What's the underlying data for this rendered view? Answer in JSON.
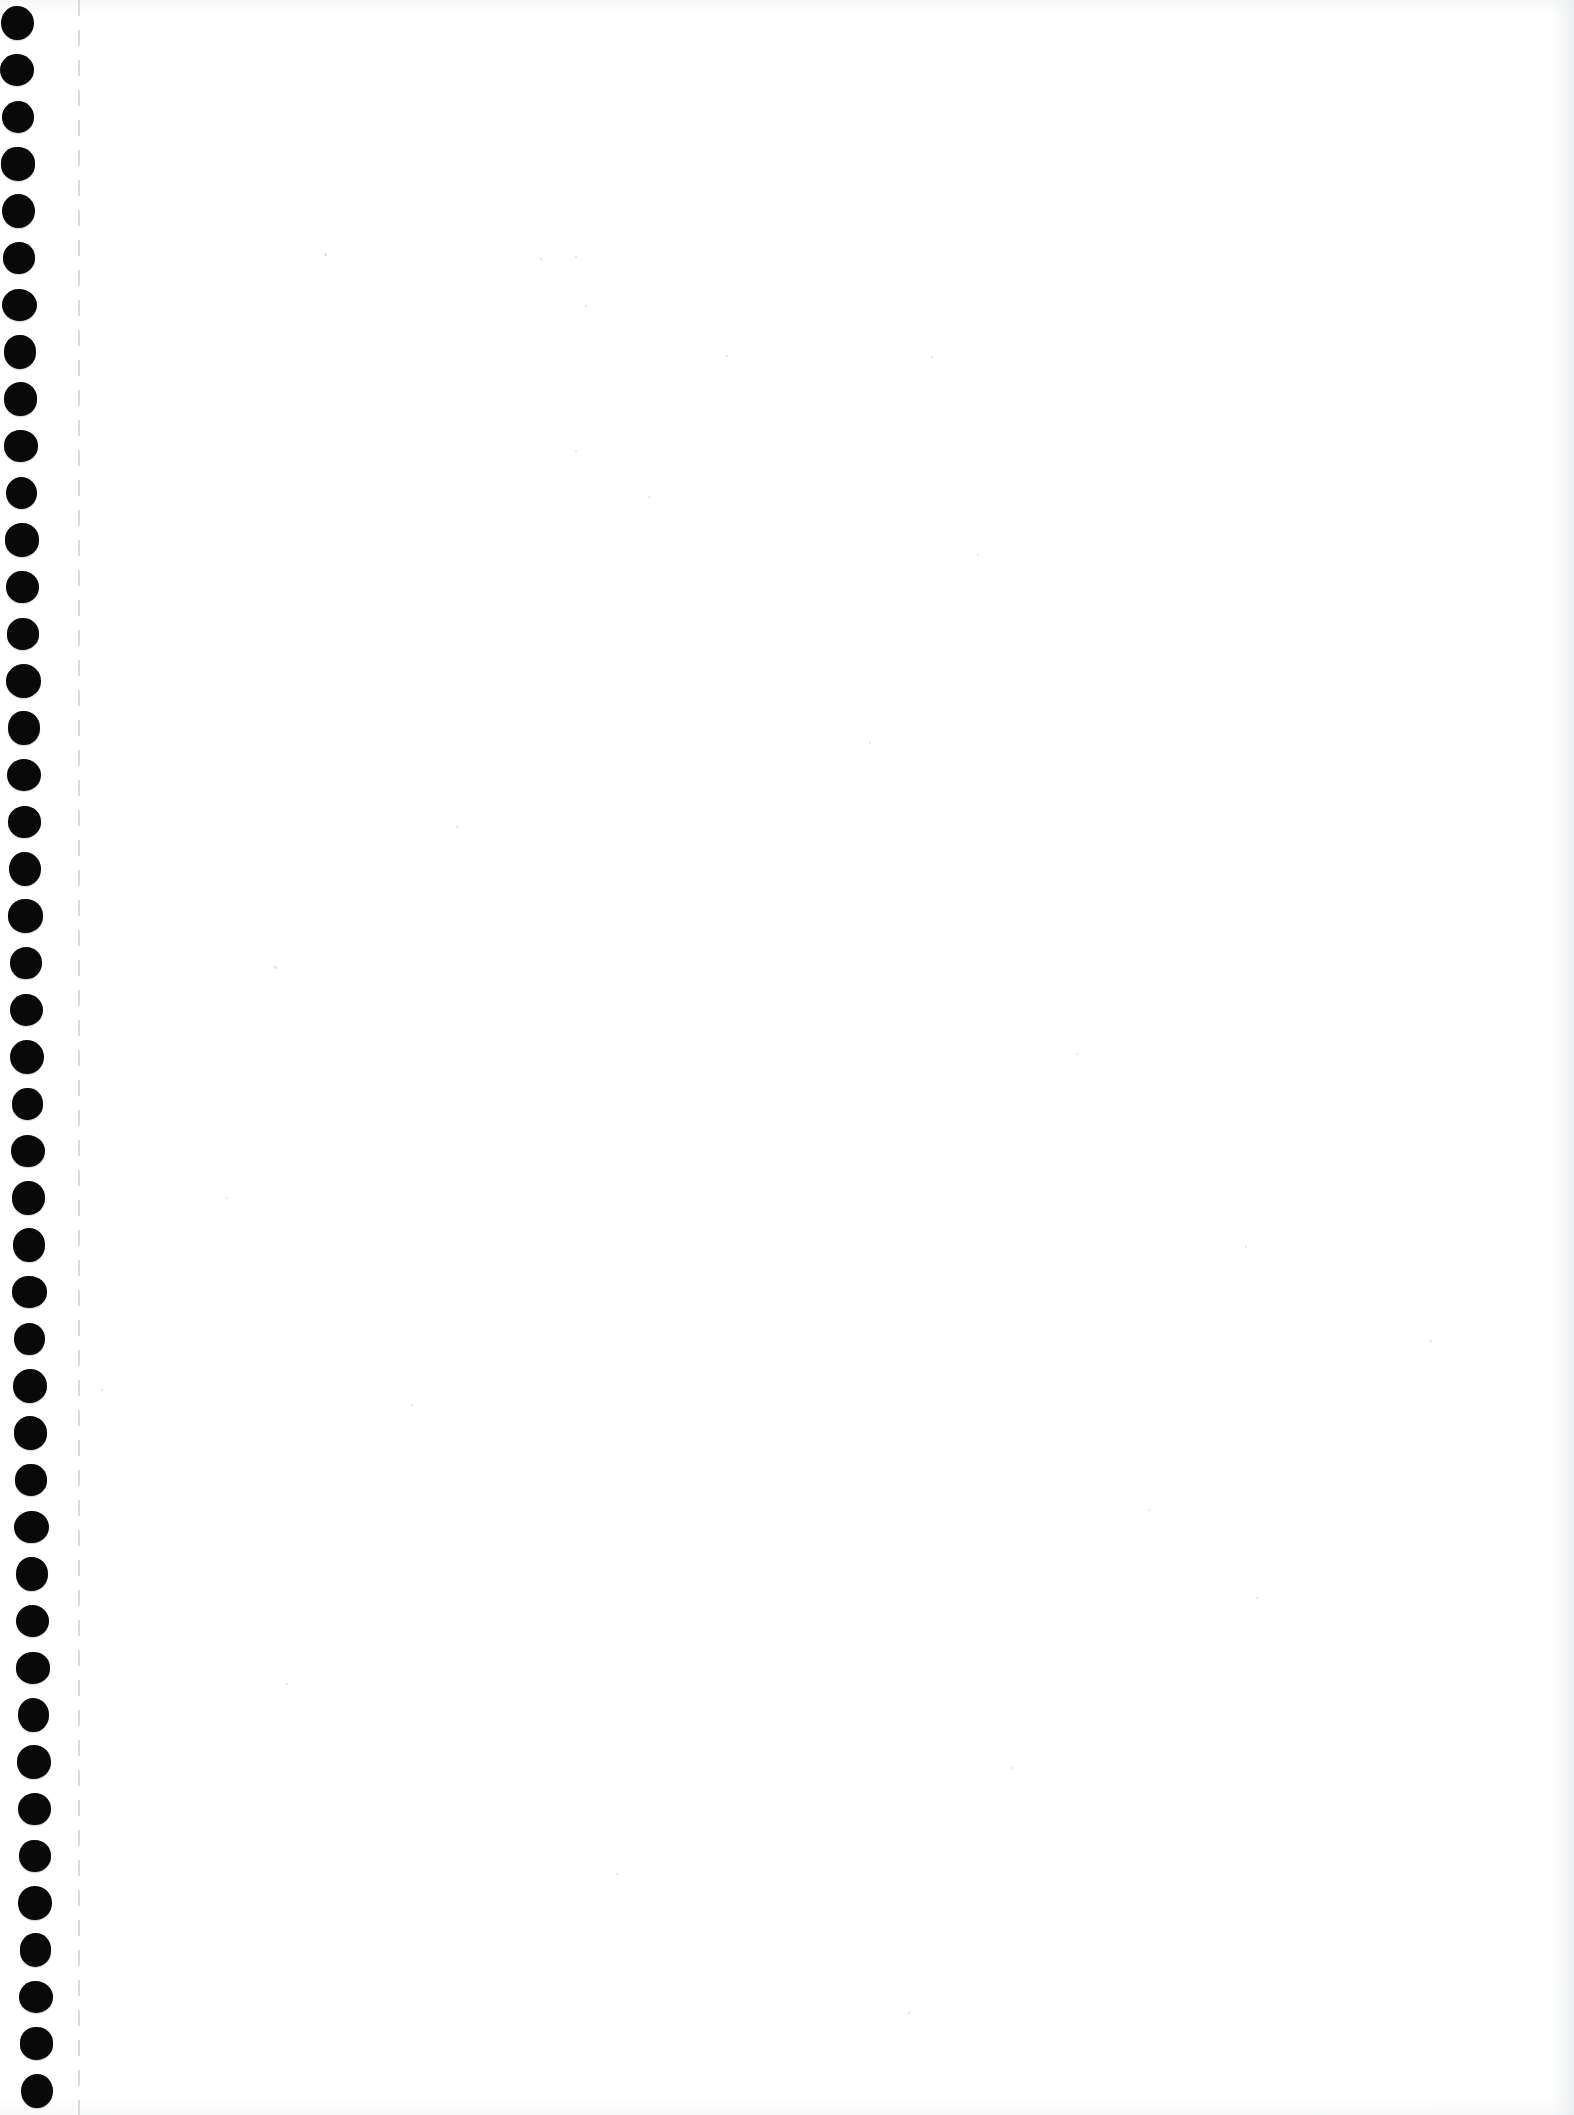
{
  "document": {
    "kind": "scanned-page",
    "title": "Scanned blank notebook page",
    "page_text": "",
    "orientation": "portrait",
    "width_px": 1574,
    "height_px": 2115,
    "background_color": "#ffffff",
    "ink_color": "#090909"
  },
  "binding": {
    "label": "Binding hole margin",
    "edge": "left",
    "strip_width_px": 96,
    "hole_count": 45,
    "hole_pitch_px": 47,
    "hole_diameter_px": 33,
    "first_hole_center": {
      "x": 17,
      "y": 23
    },
    "last_hole_center": {
      "x": 37,
      "y": 2091
    },
    "skew_note": "holes drift rightward toward the bottom of the scan",
    "hole_color": "#090909"
  },
  "perforation": {
    "label": "Perforated tear line",
    "x_px": 78,
    "style": "dashed",
    "color": "#d6d8db"
  },
  "content": {
    "body_label": "Blank page area",
    "body_text": "",
    "notes": ""
  },
  "artifacts": {
    "right_edge_shadow_color": "#e8ebee",
    "specks": [
      {
        "x": 324,
        "y": 253,
        "size": 3
      },
      {
        "x": 540,
        "y": 258,
        "size": 2
      },
      {
        "x": 575,
        "y": 256,
        "size": 2
      },
      {
        "x": 585,
        "y": 305,
        "size": 2
      },
      {
        "x": 726,
        "y": 355,
        "size": 2
      },
      {
        "x": 931,
        "y": 356,
        "size": 2
      },
      {
        "x": 575,
        "y": 450,
        "size": 2
      },
      {
        "x": 977,
        "y": 554,
        "size": 2
      },
      {
        "x": 648,
        "y": 496,
        "size": 2
      },
      {
        "x": 869,
        "y": 742,
        "size": 2
      },
      {
        "x": 456,
        "y": 826,
        "size": 2
      },
      {
        "x": 1245,
        "y": 1246,
        "size": 2
      },
      {
        "x": 274,
        "y": 966,
        "size": 3
      },
      {
        "x": 1076,
        "y": 1053,
        "size": 2
      },
      {
        "x": 226,
        "y": 1197,
        "size": 2
      },
      {
        "x": 1430,
        "y": 1340,
        "size": 2
      },
      {
        "x": 101,
        "y": 1389,
        "size": 2
      },
      {
        "x": 411,
        "y": 1404,
        "size": 2
      },
      {
        "x": 1148,
        "y": 1509,
        "size": 2
      },
      {
        "x": 1256,
        "y": 1597,
        "size": 2
      },
      {
        "x": 286,
        "y": 1683,
        "size": 2
      },
      {
        "x": 1012,
        "y": 1767,
        "size": 2
      },
      {
        "x": 616,
        "y": 1873,
        "size": 2
      },
      {
        "x": 908,
        "y": 2012,
        "size": 2
      }
    ]
  }
}
